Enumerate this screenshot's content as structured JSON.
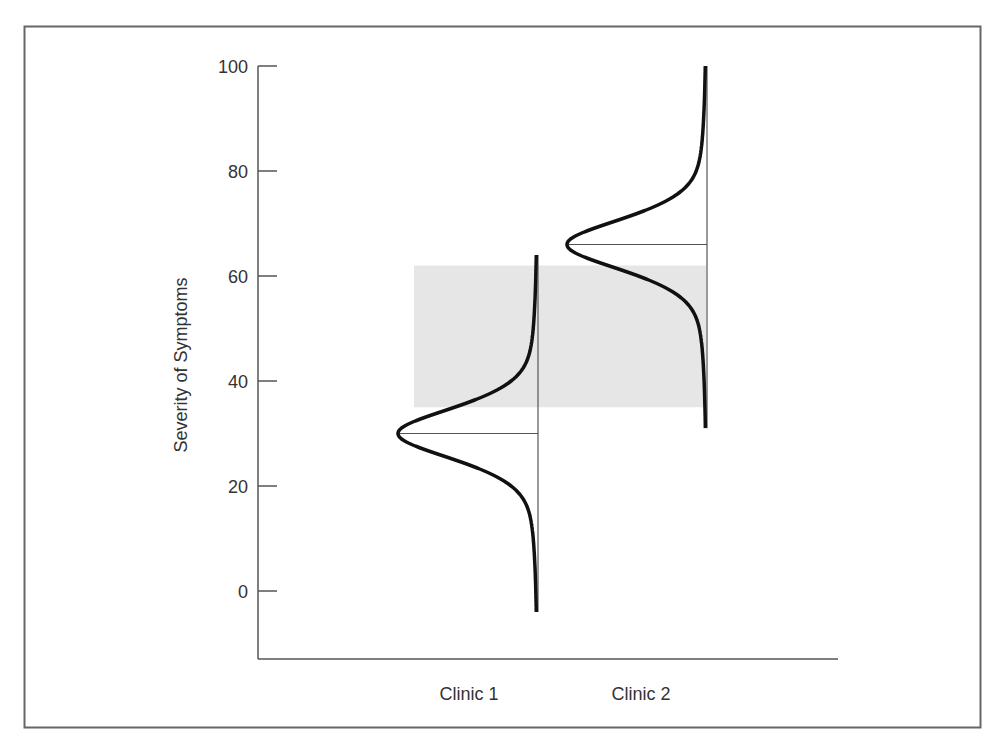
{
  "chart_data": {
    "type": "distribution",
    "title": "",
    "xlabel": "",
    "ylabel": "Severity of Symptoms",
    "ylim": [
      -13,
      100
    ],
    "yticks": [
      0,
      20,
      40,
      60,
      80,
      100
    ],
    "grid": false,
    "legend": null,
    "categories": [
      "Clinic 1",
      "Clinic 2"
    ],
    "series": [
      {
        "name": "Clinic 1",
        "mean": 30,
        "range": [
          -4,
          64
        ],
        "shape": "bell curve (drawn sideways)"
      },
      {
        "name": "Clinic 2",
        "mean": 66,
        "range": [
          31,
          100
        ],
        "shape": "bell curve (drawn sideways)"
      }
    ],
    "annotations": [
      {
        "type": "shaded-band",
        "y_from": 35,
        "y_to": 62,
        "x_span": [
          "Clinic 1",
          "Clinic 2"
        ],
        "color": "#e6e6e6"
      },
      {
        "type": "mean-line",
        "series": "Clinic 1",
        "y": 30
      },
      {
        "type": "mean-line",
        "series": "Clinic 2",
        "y": 66
      }
    ]
  },
  "colors": {
    "curve": "#111111",
    "axis": "#555555",
    "band": "#e6e6e6",
    "frame": "#666666"
  }
}
